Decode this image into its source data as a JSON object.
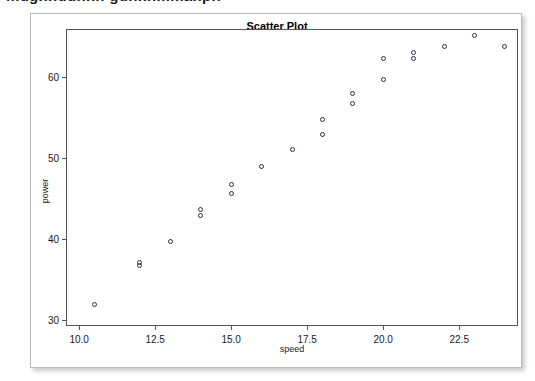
{
  "figure": {
    "title": "Scatter Plot",
    "clipped_header_remnant": "mugnnuunnn gunnnmmanpn"
  },
  "colors": {
    "frame": "#555555",
    "marker_edge": "#2b2b4a",
    "panel_border": "#b9b9b9",
    "background": "#ffffff",
    "text": "#1a1a1a"
  },
  "chart_data": {
    "type": "scatter",
    "title": "Scatter Plot",
    "xlabel": "speed",
    "ylabel": "power",
    "xlim": [
      9.6,
      24.4
    ],
    "ylim": [
      29.4,
      65.8
    ],
    "grid": false,
    "legend": "none",
    "marker": "open-circle",
    "xticks": [
      "10.0",
      "12.5",
      "15.0",
      "17.5",
      "20.0",
      "22.5"
    ],
    "xtick_values": [
      10.0,
      12.5,
      15.0,
      17.5,
      20.0,
      22.5
    ],
    "yticks": [
      "30",
      "40",
      "50",
      "60"
    ],
    "ytick_values": [
      30,
      40,
      50,
      60
    ],
    "points": [
      {
        "x": 10.5,
        "y": 31.9
      },
      {
        "x": 12.0,
        "y": 37.1
      },
      {
        "x": 12.0,
        "y": 36.7
      },
      {
        "x": 13.0,
        "y": 39.7
      },
      {
        "x": 14.0,
        "y": 43.6
      },
      {
        "x": 14.0,
        "y": 42.9
      },
      {
        "x": 15.0,
        "y": 46.7
      },
      {
        "x": 15.0,
        "y": 45.6
      },
      {
        "x": 16.0,
        "y": 48.9
      },
      {
        "x": 17.0,
        "y": 51.0
      },
      {
        "x": 18.0,
        "y": 54.8
      },
      {
        "x": 18.0,
        "y": 52.9
      },
      {
        "x": 19.0,
        "y": 58.0
      },
      {
        "x": 19.0,
        "y": 56.7
      },
      {
        "x": 20.0,
        "y": 62.3
      },
      {
        "x": 20.0,
        "y": 59.7
      },
      {
        "x": 21.0,
        "y": 63.0
      },
      {
        "x": 21.0,
        "y": 62.3
      },
      {
        "x": 22.0,
        "y": 63.8
      },
      {
        "x": 23.0,
        "y": 65.1
      },
      {
        "x": 24.0,
        "y": 63.8
      }
    ]
  }
}
